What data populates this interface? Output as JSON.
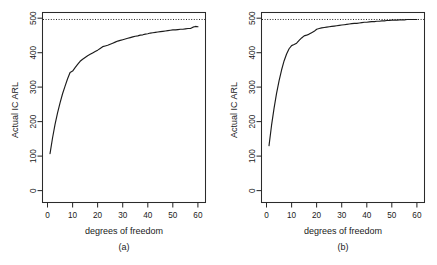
{
  "figure": {
    "width": 437,
    "height": 265,
    "background": "#ffffff",
    "foreground": "#1a1a1a",
    "panel_count": 2
  },
  "chart_data": [
    {
      "type": "line",
      "panel_label": "(a)",
      "title": "",
      "xlabel": "degrees of freedom",
      "ylabel": "Actual IC ARL",
      "xlim": [
        -2,
        63
      ],
      "ylim": [
        -25,
        520
      ],
      "xticks": [
        0,
        10,
        20,
        30,
        40,
        50,
        60
      ],
      "xticklabels": [
        "0",
        "10",
        "20",
        "30",
        "40",
        "50",
        "60"
      ],
      "yticks": [
        0,
        100,
        200,
        300,
        400,
        500
      ],
      "yticklabels": [
        "0",
        "100",
        "200",
        "300",
        "400",
        "500"
      ],
      "grid": false,
      "legend": "none",
      "annotations": [
        {
          "kind": "horizontal-reference-line",
          "y": 500,
          "style": "dotted",
          "label": "nominal IC ARL = 500"
        }
      ],
      "series": [
        {
          "name": "Actual IC ARL (a)",
          "style": "solid",
          "color": "#1c1c1c",
          "x": [
            1,
            2,
            3,
            4,
            5,
            6,
            7,
            8,
            9,
            10,
            11,
            12,
            13,
            14,
            15,
            16,
            17,
            18,
            19,
            20,
            21,
            22,
            23,
            24,
            25,
            26,
            27,
            28,
            29,
            30,
            31,
            32,
            33,
            34,
            35,
            36,
            37,
            38,
            39,
            40,
            41,
            42,
            43,
            44,
            45,
            46,
            47,
            48,
            49,
            50,
            51,
            52,
            53,
            54,
            55,
            56,
            57,
            58,
            59,
            60
          ],
          "y": [
            115,
            160,
            199,
            232,
            261,
            287,
            309,
            330,
            348,
            352,
            362,
            371,
            380,
            386,
            391,
            396,
            400,
            404,
            408,
            412,
            417,
            422,
            424,
            426,
            429,
            432,
            435,
            438,
            440,
            442,
            444,
            446,
            448,
            450,
            452,
            453,
            455,
            456,
            458,
            459,
            461,
            462,
            463,
            464,
            465,
            466,
            467,
            468,
            469,
            470,
            470,
            471,
            472,
            472,
            473,
            474,
            474,
            478,
            480,
            479
          ]
        }
      ]
    },
    {
      "type": "line",
      "panel_label": "(b)",
      "title": "",
      "xlabel": "degrees of freedom",
      "ylabel": "Actual IC ARL",
      "xlim": [
        -2,
        63
      ],
      "ylim": [
        -25,
        520
      ],
      "xticks": [
        0,
        10,
        20,
        30,
        40,
        50,
        60
      ],
      "xticklabels": [
        "0",
        "10",
        "20",
        "30",
        "40",
        "50",
        "60"
      ],
      "yticks": [
        0,
        100,
        200,
        300,
        400,
        500
      ],
      "yticklabels": [
        "0",
        "100",
        "200",
        "300",
        "400",
        "500"
      ],
      "grid": false,
      "legend": "none",
      "annotations": [
        {
          "kind": "horizontal-reference-line",
          "y": 500,
          "style": "dotted",
          "label": "nominal IC ARL = 500"
        }
      ],
      "series": [
        {
          "name": "Actual IC ARL (b)",
          "style": "solid",
          "color": "#1c1c1c",
          "x": [
            1,
            2,
            3,
            4,
            5,
            6,
            7,
            8,
            9,
            10,
            11,
            12,
            13,
            14,
            15,
            16,
            17,
            18,
            19,
            20,
            21,
            22,
            23,
            24,
            25,
            26,
            27,
            28,
            29,
            30,
            31,
            32,
            33,
            34,
            35,
            36,
            37,
            38,
            39,
            40,
            41,
            42,
            43,
            44,
            45,
            46,
            47,
            48,
            49,
            50,
            51,
            52,
            53,
            54,
            55,
            56,
            57,
            58,
            59,
            60
          ],
          "y": [
            138,
            196,
            245,
            288,
            324,
            355,
            381,
            401,
            416,
            425,
            428,
            432,
            440,
            447,
            453,
            455,
            458,
            462,
            466,
            472,
            474,
            476,
            477,
            478,
            479,
            480,
            481,
            482,
            483,
            484,
            485,
            486,
            487,
            488,
            489,
            489,
            490,
            491,
            492,
            492,
            493,
            494,
            494,
            495,
            495,
            496,
            496,
            497,
            497,
            498,
            498,
            498,
            499,
            499,
            499,
            500,
            500,
            500,
            500,
            500
          ]
        }
      ]
    }
  ]
}
